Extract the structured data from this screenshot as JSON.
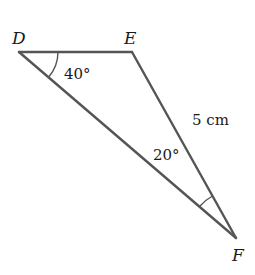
{
  "diagram": {
    "type": "triangle",
    "vertices": [
      {
        "name": "D",
        "x": 19,
        "y": 52
      },
      {
        "name": "E",
        "x": 132,
        "y": 52
      },
      {
        "name": "F",
        "x": 236,
        "y": 238
      }
    ],
    "labels": {
      "D": "D",
      "E": "E",
      "F": "F",
      "angle_D": "40°",
      "angle_F": "20°",
      "side_EF": "5 cm"
    },
    "colors": {
      "stroke": "#555555",
      "text": "#1a1a1a",
      "background": "#ffffff"
    }
  }
}
